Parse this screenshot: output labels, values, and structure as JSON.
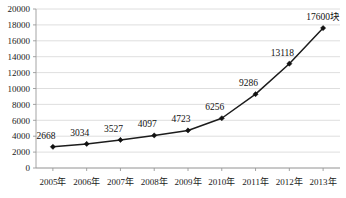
{
  "chart_data": {
    "type": "line",
    "title": "",
    "subtitle": "",
    "xlabel": "",
    "ylabel": "",
    "categories": [
      "2005年",
      "2006年",
      "2007年",
      "2008年",
      "2009年",
      "2010年",
      "2011年",
      "2012年",
      "2013年"
    ],
    "values": [
      2668,
      3034,
      3527,
      4097,
      4723,
      6256,
      9286,
      13118,
      17600
    ],
    "point_labels": [
      "2668",
      "3034",
      "3527",
      "4097",
      "4723",
      "6256",
      "9286",
      "13118",
      "17600块"
    ],
    "ylim": [
      0,
      20000
    ],
    "ytick_values": [
      0,
      2000,
      4000,
      6000,
      8000,
      10000,
      12000,
      14000,
      16000,
      18000,
      20000
    ],
    "ytick_labels": [
      "0",
      "2000",
      "4000",
      "6000",
      "8000",
      "10000",
      "12000",
      "14000",
      "16000",
      "18000",
      "20000"
    ],
    "grid": "horizontal",
    "legend": "none",
    "marker": "diamond",
    "series_color": "#1c1c1c",
    "grid_color": "#d6d6d6",
    "axis_color": "#9a9a9a",
    "unit_suffix": "块"
  }
}
